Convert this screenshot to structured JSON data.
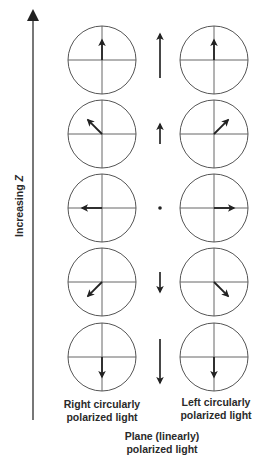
{
  "axis": {
    "label_prefix": "Increasing ",
    "label_var": "Z",
    "direction": "up"
  },
  "labels": {
    "right_circular": "Right circularly\npolarized light",
    "right_circular_line1": "Right circularly",
    "right_circular_line2": "polarized light",
    "left_circular_line1": "Left circularly",
    "left_circular_line2": "polarized light",
    "plane_line1": "Plane (linearly)",
    "plane_line2": "polarized light"
  },
  "rows": [
    {
      "right_circular_angle_deg": 90,
      "linear": "up-long",
      "left_circular_angle_deg": 90
    },
    {
      "right_circular_angle_deg": 135,
      "linear": "up-short",
      "left_circular_angle_deg": 45
    },
    {
      "right_circular_angle_deg": 180,
      "linear": "zero",
      "left_circular_angle_deg": 0
    },
    {
      "right_circular_angle_deg": 225,
      "linear": "down-short",
      "left_circular_angle_deg": 315
    },
    {
      "right_circular_angle_deg": 270,
      "linear": "down-long",
      "left_circular_angle_deg": 270
    }
  ],
  "colors": {
    "line": "#555555",
    "arrow": "#222222",
    "text": "#2a2a2a"
  }
}
